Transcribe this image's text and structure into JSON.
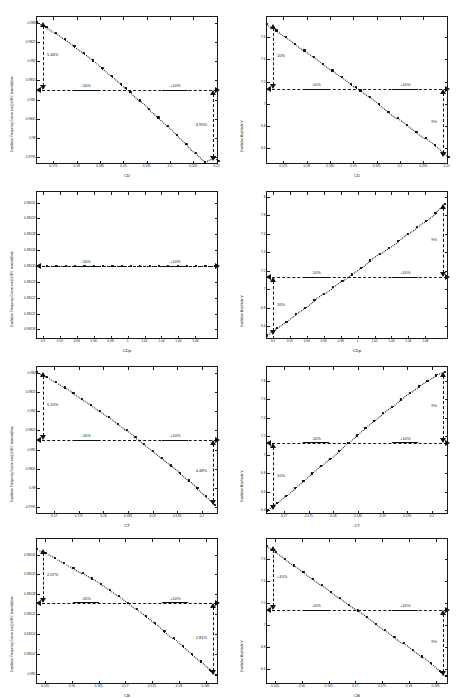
{
  "figure": {
    "caption": "",
    "rows": 4,
    "cols": 2,
    "ref_label_minus": "-10%",
    "ref_label_plus": "+10%"
  },
  "chart_data": [
    {
      "id": "r1c1",
      "type": "scatter",
      "title": "",
      "xlabel": "C_D",
      "ylabel": "Oscillation Frequency Cosine  cos(2x10^7 seconds)/sec",
      "xlim": [
        0.1715,
        0.2105
      ],
      "ylim": [
        0.9793,
        0.98315
      ],
      "xticks": [
        0.175,
        0.18,
        0.185,
        0.19,
        0.195,
        0.2,
        0.205,
        0.21
      ],
      "xticklabels": [
        "0.175",
        "0.18",
        "0.185",
        "0.19",
        "0.195",
        "0.2",
        "0.205",
        "0.21"
      ],
      "yticks": [
        0.9795,
        0.98,
        0.9805,
        0.981,
        0.9815,
        0.982,
        0.9825,
        0.983
      ],
      "yticklabels": [
        "0.9795",
        "0.98",
        "0.9805",
        "0.981",
        "0.9815",
        "0.982",
        "0.9825",
        "0.983"
      ],
      "baseline": 0.98125,
      "x": [
        0.1715,
        0.1735,
        0.1755,
        0.1775,
        0.1795,
        0.1815,
        0.1835,
        0.1855,
        0.1875,
        0.1895,
        0.1905,
        0.1915,
        0.1935,
        0.1955,
        0.1975,
        0.1995,
        0.2015,
        0.2035,
        0.2055,
        0.2075,
        0.2095,
        0.2105
      ],
      "y": [
        0.98303,
        0.9829,
        0.98274,
        0.98257,
        0.98239,
        0.98221,
        0.98202,
        0.98182,
        0.98162,
        0.98141,
        0.9813,
        0.9812,
        0.98098,
        0.98076,
        0.98054,
        0.98031,
        0.98008,
        0.97985,
        0.97961,
        0.97937,
        0.9795,
        0.9794
      ],
      "annotations": [
        {
          "text": "5.46%",
          "side": "left"
        },
        {
          "text": "4.95%",
          "side": "right"
        }
      ],
      "grid": false,
      "legend": "none"
    },
    {
      "id": "r1c2",
      "type": "scatter",
      "title": "",
      "xlabel": "C_D",
      "ylabel": "Oscillation Amplitude V",
      "xlim": [
        0.1715,
        0.2105
      ],
      "ylim": [
        6.45,
        7.78
      ],
      "xticks": [
        0.175,
        0.18,
        0.185,
        0.19,
        0.195,
        0.2,
        0.205,
        0.21
      ],
      "xticklabels": [
        "0.175",
        "0.18",
        "0.185",
        "0.19",
        "0.195",
        "0.2",
        "0.205",
        "0.21"
      ],
      "yticks": [
        6.6,
        6.8,
        7.0,
        7.2,
        7.4,
        7.6
      ],
      "yticklabels": [
        "6.6",
        "6.8",
        "7",
        "7.2",
        "7.4",
        "7.6"
      ],
      "baseline": 7.13,
      "x": [
        0.1715,
        0.1735,
        0.1755,
        0.1775,
        0.1795,
        0.1815,
        0.1835,
        0.1855,
        0.1875,
        0.1895,
        0.1905,
        0.1915,
        0.1935,
        0.1955,
        0.1975,
        0.1995,
        0.2015,
        0.2035,
        0.2055,
        0.2075,
        0.2095,
        0.2105
      ],
      "y": [
        7.72,
        7.66,
        7.6,
        7.54,
        7.48,
        7.42,
        7.36,
        7.3,
        7.24,
        7.18,
        7.15,
        7.12,
        7.06,
        7.0,
        6.93,
        6.87,
        6.81,
        6.75,
        6.69,
        6.63,
        6.56,
        6.52
      ],
      "annotations": [
        {
          "text": "10%",
          "side": "left"
        },
        {
          "text": "9%",
          "side": "right"
        }
      ],
      "grid": false,
      "legend": "none"
    },
    {
      "id": "r2c1",
      "type": "scatter",
      "title": "",
      "xlabel": "C_Dp",
      "ylabel": "Oscillation Frequency Cosine  cos(2x10^7 seconds)/sec",
      "xlim": [
        0.893,
        1.108
      ],
      "ylim": [
        0.98118,
        0.98132
      ],
      "xticks": [
        0.9,
        0.92,
        0.94,
        0.96,
        0.98,
        1.0,
        1.02,
        1.04,
        1.06,
        1.08
      ],
      "xticklabels": [
        "0.9",
        "0.92",
        "0.94",
        "0.96",
        "0.98",
        "1",
        "1.02",
        "1.04",
        "1.06",
        "1.08"
      ],
      "yticks": [
        0.98119,
        0.981205,
        0.98122,
        0.981235,
        0.98125,
        0.981265,
        0.98128,
        0.981295,
        0.98131
      ],
      "yticklabels": [
        "0.98118",
        "0.98121",
        "0.98122",
        "0.98123",
        "0.98125",
        "0.98126",
        "0.98128",
        "0.98129",
        "0.98131"
      ],
      "baseline": 0.98125,
      "x": [
        0.893,
        0.905,
        0.916,
        0.927,
        0.938,
        0.949,
        0.96,
        0.971,
        0.982,
        0.993,
        1.004,
        1.015,
        1.026,
        1.037,
        1.048,
        1.059,
        1.07,
        1.081,
        1.092,
        1.103
      ],
      "y": [
        0.98125,
        0.98125,
        0.98125,
        0.98125,
        0.98125,
        0.98125,
        0.98125,
        0.98125,
        0.98125,
        0.98125,
        0.98125,
        0.98125,
        0.98125,
        0.98125,
        0.98125,
        0.98125,
        0.98125,
        0.98125,
        0.98125,
        0.98125
      ],
      "annotations": [],
      "grid": false,
      "legend": "none"
    },
    {
      "id": "r2c2",
      "type": "scatter",
      "title": "",
      "xlabel": "C_Dp",
      "ylabel": "Oscillation Amplitude V",
      "xlim": [
        0.893,
        1.108
      ],
      "ylim": [
        6.45,
        8.05
      ],
      "xticks": [
        0.9,
        0.92,
        0.94,
        0.96,
        0.98,
        1.0,
        1.02,
        1.04,
        1.06,
        1.08
      ],
      "xticklabels": [
        "0.9",
        "0.92",
        "0.94",
        "0.96",
        "0.98",
        "1",
        "1.02",
        "1.04",
        "1.06",
        "1.08"
      ],
      "yticks": [
        6.6,
        6.8,
        7.0,
        7.2,
        7.4,
        7.6,
        7.8,
        8.0
      ],
      "yticklabels": [
        "6.6",
        "6.8",
        "7",
        "7.2",
        "7.4",
        "7.6",
        "7.8",
        "8"
      ],
      "baseline": 7.13,
      "x": [
        0.893,
        0.905,
        0.916,
        0.927,
        0.938,
        0.949,
        0.96,
        0.971,
        0.982,
        0.993,
        1.004,
        1.015,
        1.026,
        1.037,
        1.048,
        1.059,
        1.07,
        1.081,
        1.092,
        1.103
      ],
      "y": [
        6.5,
        6.58,
        6.65,
        6.73,
        6.8,
        6.88,
        6.95,
        7.02,
        7.09,
        7.16,
        7.23,
        7.31,
        7.38,
        7.45,
        7.52,
        7.6,
        7.67,
        7.74,
        7.82,
        7.92
      ],
      "annotations": [
        {
          "text": "10%",
          "side": "left"
        },
        {
          "text": "9%",
          "side": "right"
        }
      ],
      "grid": false,
      "legend": "none"
    },
    {
      "id": "r3c1",
      "type": "scatter",
      "title": "",
      "xlabel": "C_T",
      "ylabel": "Oscillation Frequency Cosine  cos(2x10^7 seconds)/sec",
      "xlim": [
        0.1665,
        0.2035
      ],
      "ylim": [
        0.9793,
        0.98315
      ],
      "xticks": [
        0.17,
        0.175,
        0.18,
        0.185,
        0.19,
        0.195,
        0.2
      ],
      "xticklabels": [
        "0.17",
        "0.175",
        "0.18",
        "0.185",
        "0.19",
        "0.195",
        "0.2"
      ],
      "yticks": [
        0.9795,
        0.98,
        0.9805,
        0.981,
        0.9815,
        0.982,
        0.9825,
        0.983
      ],
      "yticklabels": [
        "0.9795",
        "0.98",
        "0.9805",
        "0.981",
        "0.9815",
        "0.982",
        "0.9825",
        "0.983"
      ],
      "baseline": 0.98125,
      "x": [
        0.1665,
        0.1685,
        0.1703,
        0.1721,
        0.1739,
        0.1757,
        0.1775,
        0.1793,
        0.1811,
        0.1829,
        0.1847,
        0.1865,
        0.1883,
        0.1901,
        0.1919,
        0.1937,
        0.1955,
        0.1973,
        0.1991,
        0.2009,
        0.2027
      ],
      "y": [
        0.98302,
        0.98289,
        0.98276,
        0.98262,
        0.98247,
        0.98232,
        0.98217,
        0.98201,
        0.98185,
        0.98168,
        0.98151,
        0.98133,
        0.98115,
        0.98097,
        0.98078,
        0.98059,
        0.9804,
        0.9802,
        0.98,
        0.97979,
        0.97957
      ],
      "annotations": [
        {
          "text": "5.20%",
          "side": "left"
        },
        {
          "text": "4.48%",
          "side": "right"
        }
      ],
      "grid": false,
      "legend": "none"
    },
    {
      "id": "r3c2",
      "type": "scatter",
      "title": "",
      "xlabel": "CT",
      "ylabel": "Oscillation Amplitude V",
      "xlim": [
        0.1665,
        0.2035
      ],
      "ylim": [
        6.35,
        7.95
      ],
      "xticks": [
        0.17,
        0.175,
        0.18,
        0.185,
        0.19,
        0.195,
        0.2
      ],
      "xticklabels": [
        "0.17",
        "0.175",
        "0.18",
        "0.185",
        "0.19",
        "0.195",
        "0.2"
      ],
      "yticks": [
        6.4,
        6.6,
        6.8,
        7.0,
        7.2,
        7.4,
        7.6,
        7.8
      ],
      "yticklabels": [
        "6.4",
        "6.6",
        "6.8",
        "7",
        "7.2",
        "7.4",
        "7.6",
        "7.8"
      ],
      "baseline": 7.13,
      "x": [
        0.1665,
        0.1685,
        0.1703,
        0.1721,
        0.1739,
        0.1757,
        0.1775,
        0.1793,
        0.1811,
        0.1829,
        0.1847,
        0.1865,
        0.1883,
        0.1901,
        0.1919,
        0.1937,
        0.1955,
        0.1973,
        0.1991,
        0.2009,
        0.2027
      ],
      "y": [
        6.4,
        6.48,
        6.56,
        6.64,
        6.72,
        6.8,
        6.88,
        6.96,
        7.04,
        7.13,
        7.21,
        7.29,
        7.37,
        7.45,
        7.52,
        7.6,
        7.67,
        7.74,
        7.8,
        7.86,
        7.9
      ],
      "annotations": [
        {
          "text": "10%",
          "side": "left"
        },
        {
          "text": "9%",
          "side": "right"
        }
      ],
      "grid": false,
      "legend": "none"
    },
    {
      "id": "r4c1",
      "type": "scatter",
      "title": "",
      "xlabel": "C_B",
      "ylabel": "Oscillation Frequency Cosine  cos(2x10^7 seconds)/sec",
      "xlim": [
        0.1535,
        0.1875
      ],
      "ylim": [
        0.98096,
        0.981475
      ],
      "xticks": [
        0.155,
        0.16,
        0.165,
        0.17,
        0.175,
        0.18,
        0.185
      ],
      "xticklabels": [
        "0.155",
        "0.16",
        "0.165",
        "0.17",
        "0.175",
        "0.18",
        "0.185"
      ],
      "yticks": [
        0.981,
        0.98107,
        0.98114,
        0.98121,
        0.98128,
        0.98135,
        0.98142
      ],
      "yticklabels": [
        "0.981",
        "0.98107",
        "0.98114",
        "0.98121",
        "0.98128",
        "0.98135",
        "0.98142"
      ],
      "baseline": 0.98125,
      "x": [
        0.1535,
        0.1552,
        0.1569,
        0.1586,
        0.1603,
        0.162,
        0.1637,
        0.1654,
        0.1671,
        0.1688,
        0.1705,
        0.1722,
        0.1739,
        0.1756,
        0.1773,
        0.179,
        0.1807,
        0.1824,
        0.1841,
        0.1858,
        0.187
      ],
      "y": [
        0.98144,
        0.981425,
        0.981409,
        0.981392,
        0.981374,
        0.981355,
        0.981336,
        0.981316,
        0.981295,
        0.981273,
        0.98125,
        0.981227,
        0.981203,
        0.981178,
        0.981152,
        0.981126,
        0.981099,
        0.981071,
        0.981043,
        0.981014,
        0.980995
      ],
      "annotations": [
        {
          "text": "2.07%",
          "side": "left"
        },
        {
          "text": "1.81%",
          "side": "right"
        }
      ],
      "grid": false,
      "legend": "none"
    },
    {
      "id": "r4c2",
      "type": "scatter",
      "title": "",
      "xlabel": "C_B",
      "ylabel": "Oscillation Amplitude V",
      "xlim": [
        0.1535,
        0.1875
      ],
      "ylim": [
        6.45,
        7.78
      ],
      "xticks": [
        0.155,
        0.16,
        0.165,
        0.17,
        0.175,
        0.18,
        0.185
      ],
      "xticklabels": [
        "0.155",
        "0.16",
        "0.165",
        "0.17",
        "0.175",
        "0.18",
        "0.185"
      ],
      "yticks": [
        6.6,
        6.8,
        7.0,
        7.2,
        7.4,
        7.6
      ],
      "yticklabels": [
        "6.6",
        "6.8",
        "7",
        "7.2",
        "7.4",
        "7.6"
      ],
      "baseline": 7.13,
      "x": [
        0.1535,
        0.1552,
        0.1569,
        0.1586,
        0.1603,
        0.162,
        0.1637,
        0.1654,
        0.1671,
        0.1688,
        0.1705,
        0.1722,
        0.1739,
        0.1756,
        0.1773,
        0.179,
        0.1807,
        0.1824,
        0.1841,
        0.1858,
        0.187
      ],
      "y": [
        7.72,
        7.66,
        7.6,
        7.54,
        7.48,
        7.42,
        7.36,
        7.3,
        7.24,
        7.18,
        7.13,
        7.07,
        7.01,
        6.95,
        6.89,
        6.83,
        6.77,
        6.71,
        6.65,
        6.58,
        6.53
      ],
      "annotations": [
        {
          "text": "+10%",
          "side": "left"
        },
        {
          "text": "9%",
          "side": "right"
        }
      ],
      "grid": false,
      "legend": "none"
    }
  ]
}
